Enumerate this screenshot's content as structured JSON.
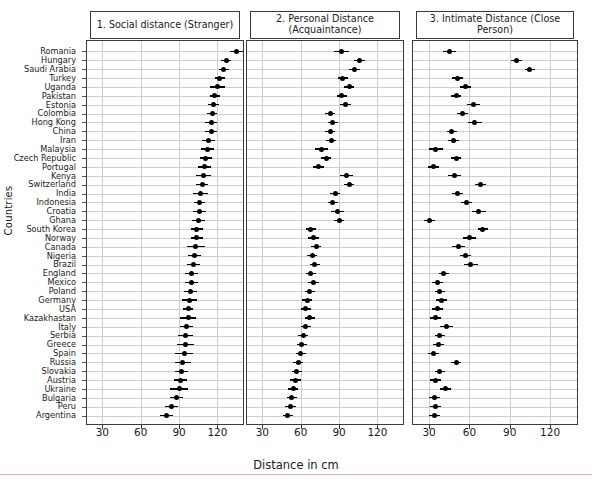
{
  "figure": {
    "xlabel": "Distance in cm",
    "ylabel": "Countries",
    "xticks": [
      30,
      60,
      90,
      120
    ],
    "xlim": [
      18,
      140
    ]
  },
  "panels": [
    {
      "id": "panel-social",
      "title": "1. Social distance (Stranger)"
    },
    {
      "id": "panel-personal",
      "title": "2. Personal Distance (Acquaintance)"
    },
    {
      "id": "panel-intimate",
      "title": "3. Intimate Distance (Close Person)"
    }
  ],
  "chart_data": {
    "type": "scatter",
    "xlabel": "Distance in cm",
    "ylabel": "Countries",
    "xlim": [
      18,
      140
    ],
    "xticks": [
      30,
      60,
      90,
      120
    ],
    "grid": true,
    "legend": null,
    "panel_titles": [
      "1. Social distance (Stranger)",
      "2. Personal Distance (Acquaintance)",
      "3. Intimate Distance (Close Person)"
    ],
    "categories": [
      "Romania",
      "Hungary",
      "Saudi Arabia",
      "Turkey",
      "Uganda",
      "Pakistan",
      "Estonia",
      "Colombia",
      "Hong Kong",
      "China",
      "Iran",
      "Malaysia",
      "Czech Republic",
      "Portugal",
      "Kenya",
      "Switzerland",
      "India",
      "Indonesia",
      "Croatia",
      "Ghana",
      "South Korea",
      "Norway",
      "Canada",
      "Nigeria",
      "Brazil",
      "England",
      "Mexico",
      "Poland",
      "Germany",
      "USA",
      "Kazakhastan",
      "Italy",
      "Serbia",
      "Greece",
      "Spain",
      "Russia",
      "Slovakia",
      "Austria",
      "Ukraine",
      "Bulgaria",
      "Peru",
      "Argentina"
    ],
    "series": [
      {
        "name": "1. Social distance (Stranger)",
        "values": [
          135,
          127,
          125,
          122,
          120,
          118,
          117,
          116,
          115,
          115,
          113,
          112,
          111,
          110,
          109,
          108,
          107,
          106,
          106,
          105,
          104,
          104,
          103,
          102,
          101,
          100,
          100,
          99,
          98,
          97,
          97,
          96,
          95,
          95,
          94,
          93,
          92,
          91,
          90,
          88,
          84,
          80
        ],
        "ci_low": [
          130,
          123,
          121,
          118,
          114,
          114,
          113,
          112,
          110,
          110,
          108,
          107,
          106,
          105,
          103,
          103,
          101,
          102,
          101,
          100,
          99,
          99,
          96,
          97,
          96,
          95,
          95,
          94,
          92,
          93,
          91,
          91,
          89,
          88,
          87,
          87,
          87,
          86,
          83,
          83,
          79,
          75
        ],
        "ci_high": [
          140,
          131,
          129,
          126,
          126,
          122,
          121,
          120,
          120,
          120,
          118,
          117,
          116,
          115,
          115,
          113,
          113,
          110,
          111,
          110,
          109,
          109,
          110,
          107,
          106,
          105,
          105,
          104,
          104,
          101,
          103,
          101,
          101,
          102,
          101,
          99,
          97,
          96,
          97,
          93,
          89,
          85
        ]
      },
      {
        "name": "2. Personal Distance (Acquaintance)",
        "values": [
          92,
          106,
          102,
          93,
          98,
          92,
          95,
          83,
          85,
          83,
          84,
          76,
          80,
          74,
          96,
          98,
          87,
          85,
          89,
          90,
          68,
          70,
          72,
          69,
          71,
          68,
          70,
          67,
          65,
          64,
          67,
          64,
          62,
          61,
          60,
          58,
          57,
          56,
          54,
          53,
          52,
          50
        ],
        "ci_low": [
          86,
          102,
          98,
          89,
          94,
          88,
          91,
          79,
          81,
          79,
          80,
          71,
          76,
          70,
          91,
          94,
          83,
          81,
          84,
          86,
          64,
          66,
          68,
          65,
          67,
          64,
          66,
          63,
          61,
          60,
          63,
          60,
          58,
          57,
          56,
          54,
          53,
          52,
          50,
          49,
          48,
          46
        ],
        "ci_high": [
          98,
          110,
          106,
          97,
          102,
          96,
          99,
          87,
          89,
          87,
          88,
          81,
          84,
          78,
          101,
          102,
          91,
          89,
          94,
          94,
          72,
          74,
          76,
          73,
          75,
          72,
          74,
          71,
          69,
          68,
          71,
          68,
          66,
          65,
          64,
          62,
          61,
          60,
          58,
          57,
          56,
          54
        ]
      },
      {
        "name": "3. Intimate Distance (Close Person)",
        "values": [
          45,
          95,
          105,
          51,
          57,
          50,
          63,
          55,
          64,
          47,
          48,
          35,
          50,
          33,
          49,
          68,
          51,
          58,
          67,
          30,
          70,
          60,
          52,
          57,
          61,
          41,
          36,
          38,
          39,
          36,
          35,
          43,
          38,
          37,
          33,
          50,
          38,
          35,
          42,
          34,
          35,
          34
        ],
        "ci_low": [
          40,
          91,
          101,
          47,
          53,
          46,
          58,
          51,
          59,
          43,
          44,
          30,
          46,
          29,
          44,
          64,
          47,
          54,
          62,
          26,
          66,
          55,
          47,
          53,
          56,
          37,
          32,
          34,
          35,
          32,
          31,
          38,
          34,
          33,
          29,
          46,
          34,
          31,
          38,
          30,
          31,
          30
        ],
        "ci_high": [
          50,
          99,
          109,
          55,
          61,
          54,
          68,
          59,
          69,
          51,
          52,
          40,
          54,
          37,
          54,
          72,
          55,
          62,
          72,
          34,
          74,
          65,
          57,
          61,
          66,
          45,
          40,
          42,
          43,
          40,
          39,
          48,
          42,
          41,
          37,
          54,
          42,
          39,
          46,
          38,
          39,
          38
        ]
      }
    ]
  }
}
